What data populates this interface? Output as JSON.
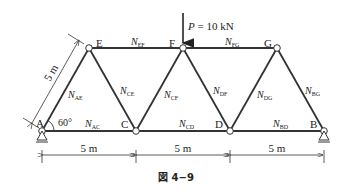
{
  "figure": {
    "caption": "図 4−9",
    "load": {
      "symbol": "P",
      "value": "= 10 kN"
    },
    "angle": "60°",
    "side_length": "5 m",
    "nodes": {
      "A": {
        "label": "A",
        "x": 42,
        "y": 131
      },
      "C": {
        "label": "C",
        "x": 136,
        "y": 131
      },
      "D": {
        "label": "D",
        "x": 230,
        "y": 131
      },
      "B": {
        "label": "B",
        "x": 324,
        "y": 131
      },
      "E": {
        "label": "E",
        "x": 89,
        "y": 48
      },
      "F": {
        "label": "F",
        "x": 183,
        "y": 48
      },
      "G": {
        "label": "G",
        "x": 277,
        "y": 48
      }
    },
    "members": {
      "AE": {
        "N": "N",
        "sub": "AE"
      },
      "AC": {
        "N": "N",
        "sub": "AC"
      },
      "CE": {
        "N": "N",
        "sub": "CE"
      },
      "CF": {
        "N": "N",
        "sub": "CF"
      },
      "CD": {
        "N": "N",
        "sub": "CD"
      },
      "DF": {
        "N": "N",
        "sub": "DF"
      },
      "DG": {
        "N": "N",
        "sub": "DG"
      },
      "BD": {
        "N": "N",
        "sub": "BD"
      },
      "BG": {
        "N": "N",
        "sub": "BG"
      },
      "EF": {
        "N": "N",
        "sub": "EF"
      },
      "FG": {
        "N": "N",
        "sub": "FG"
      }
    },
    "dimensions": [
      "5 m",
      "5 m",
      "5 m"
    ]
  }
}
